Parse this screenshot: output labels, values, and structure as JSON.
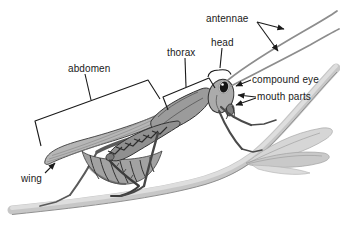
{
  "figure": {
    "labels": {
      "antennae": "antennae",
      "head": "head",
      "thorax": "thorax",
      "abdomen": "abdomen",
      "compound_eye": "compound eye",
      "mouth_parts": "mouth parts",
      "wing": "wing"
    },
    "colors": {
      "background": "#ffffff",
      "label_text": "#1a1a1a",
      "leader_line": "#1a1a1a",
      "body_gray": "#9a9a9a",
      "wing_gray": "#b6b6b6",
      "stem_gray": "#c7c7c7",
      "eye_black": "#151515"
    }
  }
}
